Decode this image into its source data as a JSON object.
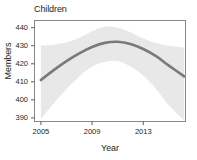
{
  "chart_data": {
    "type": "line",
    "title": "Children",
    "xlabel": "Year",
    "ylabel": "Members",
    "grid": false,
    "legend": null,
    "xlim": [
      2004.5,
      2016.3
    ],
    "ylim": [
      388,
      444
    ],
    "xticks": [
      2005,
      2009,
      2013
    ],
    "xtick_labels": [
      "2005",
      "2009",
      "2013"
    ],
    "yticks": [
      390,
      400,
      410,
      420,
      430,
      440
    ],
    "ytick_labels": [
      "390",
      "400",
      "410",
      "420",
      "430",
      "440"
    ],
    "series": [
      {
        "name": "Children members fitted trend",
        "style": "smooth-line",
        "color": "#7a7a7a",
        "x": [
          2005.0,
          2006.0,
          2007.0,
          2008.0,
          2009.0,
          2010.0,
          2011.0,
          2012.0,
          2013.0,
          2014.0,
          2015.0,
          2016.2
        ],
        "y": [
          411.0,
          416.5,
          421.5,
          425.8,
          429.3,
          431.6,
          432.2,
          431.0,
          428.2,
          424.2,
          419.0,
          413.0
        ]
      },
      {
        "name": "confidence band upper",
        "style": "band",
        "color": "#e6e6e6",
        "x": [
          2005.0,
          2006.0,
          2007.0,
          2008.0,
          2009.0,
          2010.0,
          2011.0,
          2012.0,
          2013.0,
          2014.0,
          2015.0,
          2016.2
        ],
        "y": [
          430.0,
          430.5,
          432.0,
          434.5,
          438.0,
          440.5,
          440.0,
          437.5,
          434.0,
          431.5,
          430.0,
          429.0
        ]
      },
      {
        "name": "confidence band lower",
        "style": "band",
        "color": "#e6e6e6",
        "x": [
          2005.0,
          2006.0,
          2007.0,
          2008.0,
          2009.0,
          2010.0,
          2011.0,
          2012.0,
          2013.0,
          2014.0,
          2015.0,
          2016.2
        ],
        "y": [
          389.5,
          398.0,
          406.0,
          413.0,
          418.5,
          421.0,
          421.5,
          418.5,
          413.5,
          406.0,
          397.0,
          388.5
        ]
      }
    ],
    "colors": {
      "line": "#7a7a7a",
      "band": "#e8e8e8",
      "axis": "#6d6d6d",
      "text": "#231f20",
      "background": "#ffffff"
    }
  }
}
